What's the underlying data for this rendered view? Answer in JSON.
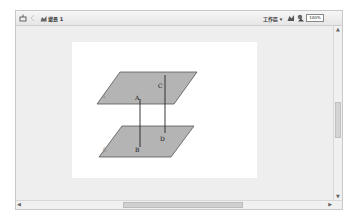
{
  "toolbar": {
    "left": {
      "tool_icon": "insert-icon",
      "back_icon": "arrow-left-icon",
      "scene_icon": "scene-icon",
      "scene_label": "場景 1"
    },
    "right": {
      "workspace_label": "工作區 ▾",
      "edit_symbol_icon": "edit-symbol-icon",
      "edit_scene_icon": "edit-scene-icon",
      "zoom_value": "100%",
      "dropdown_icon": "chevron-down-icon"
    }
  },
  "figure": {
    "plane_top_label": "α",
    "plane_bottom_label": "β",
    "points": [
      "A",
      "B",
      "C",
      "D"
    ],
    "plane_fill": "#b4b4b4",
    "plane_stroke": "#555555"
  },
  "scrollbars": {
    "up_arrow": "▲",
    "down_arrow": "▼",
    "left_arrow": "◀",
    "right_arrow": "▶"
  }
}
